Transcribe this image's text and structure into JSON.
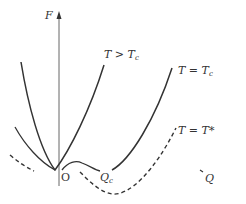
{
  "diagram": {
    "type": "free-energy-vs-order-parameter",
    "axes": {
      "y_label": "F",
      "x_label": "Q",
      "origin_label": "O"
    },
    "curves": [
      {
        "id": "T_gt_Tc",
        "label_main": "T > T",
        "label_sub": "c",
        "style": "solid"
      },
      {
        "id": "T_eq_Tc",
        "label_main": "T = T",
        "label_sub": "c",
        "style": "solid"
      },
      {
        "id": "T_eq_Tstar",
        "label_main": "T = T*",
        "label_sub": "",
        "style": "dashed"
      },
      {
        "id": "left_solid",
        "label_main": "",
        "label_sub": "",
        "style": "solid"
      }
    ],
    "points": [
      {
        "id": "Qc",
        "label_main": "Q",
        "label_sub": "c"
      }
    ],
    "colors": {
      "line": "#333333",
      "axis": "#666666",
      "background": "#ffffff"
    }
  }
}
